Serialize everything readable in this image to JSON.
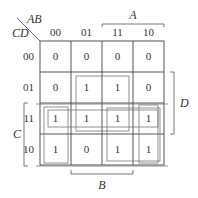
{
  "kmap": {
    "row_var": "CD",
    "col_var": "AB",
    "col_headers": [
      "00",
      "01",
      "11",
      "10"
    ],
    "row_headers": [
      "00",
      "01",
      "11",
      "10"
    ],
    "cells": [
      [
        "0",
        "0",
        "0",
        "0"
      ],
      [
        "0",
        "1",
        "1",
        "0"
      ],
      [
        "1",
        "1",
        "1",
        "1"
      ],
      [
        "1",
        "0",
        "1",
        "1"
      ]
    ],
    "brackets": {
      "top": "A",
      "right": "D",
      "left": "C",
      "bottom": "B"
    },
    "groups": [
      {
        "name": "BD",
        "rows": [
          1,
          2
        ],
        "cols": [
          1,
          2
        ]
      },
      {
        "name": "CD",
        "rows": [
          2
        ],
        "cols": [
          0,
          1,
          2,
          3
        ]
      },
      {
        "name": "AC",
        "rows": [
          2,
          3
        ],
        "cols": [
          2,
          3
        ]
      },
      {
        "name": "AB'C",
        "rows": [
          2,
          3
        ],
        "cols": [
          3
        ]
      },
      {
        "name": "A'B'C",
        "rows": [
          2,
          3
        ],
        "cols": [
          0
        ]
      },
      {
        "name": "B'C-wrap",
        "rows": [
          2,
          3
        ],
        "cols": [
          0,
          3
        ]
      }
    ]
  }
}
